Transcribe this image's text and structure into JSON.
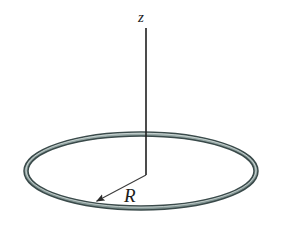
{
  "figure": {
    "background_color": "#ffffff",
    "width": 281,
    "height": 235,
    "labels": {
      "axis_label": "z",
      "radius_label": "R"
    },
    "colors": {
      "ring_stroke": "#3a4a4a",
      "ring_fill": "#9fb0ae",
      "ring_highlight": "#cdd8d6",
      "axis_line": "#1f1f1f",
      "radius_line": "#444444",
      "text": "#1c1c1c"
    },
    "geometry": {
      "ring": {
        "shape": "ellipse-annulus",
        "center_x": 141,
        "center_y": 171,
        "outer_rx": 117,
        "outer_ry": 39,
        "inner_rx": 113,
        "inner_ry": 35,
        "band_thickness": 4
      },
      "axis": {
        "name": "z-axis",
        "x": 146,
        "y_top": 28,
        "y_bottom": 175,
        "stroke_width": 1.6
      },
      "radius_arrow": {
        "from_x": 146,
        "from_y": 175,
        "to_x": 93,
        "to_y": 203,
        "stroke_width": 1.2,
        "arrowhead": "filled-triangle"
      },
      "label_positions": {
        "z": {
          "x": 141,
          "y": 22
        },
        "R": {
          "x": 124,
          "y": 202
        }
      }
    }
  }
}
